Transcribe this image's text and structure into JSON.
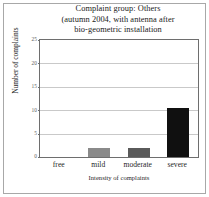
{
  "chart_data": {
    "type": "bar",
    "title": "Complaint group: Others (autumn 2004, with antenna after bio-geometric installation",
    "title_lines": [
      "Complaint group: Others",
      "(autumn 2004, with antenna after",
      "bio-geometric installation"
    ],
    "categories": [
      "free",
      "mild",
      "moderate",
      "severe"
    ],
    "values": [
      0,
      2,
      2,
      10.5
    ],
    "xlabel": "Intensity of complaints",
    "ylabel": "Number of complaints",
    "ylim": [
      0,
      25
    ],
    "yticks": [
      0,
      5,
      10,
      15,
      20,
      25
    ],
    "ytick_labels": [
      "0",
      "5",
      "10",
      "15",
      "20",
      "25"
    ],
    "grid": true,
    "legend": false,
    "bar_colors": [
      "#ffffff",
      "#8a8a8a",
      "#5a5a5a",
      "#101010"
    ],
    "axis_color": "#6e6e6e",
    "grid_color": "#c9c9c9",
    "frame_color": "#a8a8a8",
    "background": "#ffffff"
  }
}
